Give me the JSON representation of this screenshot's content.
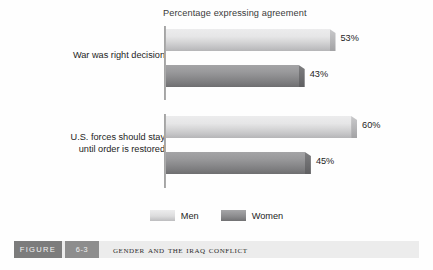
{
  "chart_data": {
    "type": "bar",
    "orientation": "horizontal",
    "title": "Percentage expressing agreement",
    "xlabel": "",
    "ylabel": "",
    "xlim": [
      0,
      70
    ],
    "grid": false,
    "legend_position": "bottom-center",
    "categories": [
      "War was right decision",
      "U.S. forces should stay\nuntil order is restored"
    ],
    "series": [
      {
        "name": "Men",
        "color": "#dcdcdd",
        "values": [
          53,
          60
        ],
        "value_labels": [
          "53%",
          "60%"
        ]
      },
      {
        "name": "Women",
        "color": "#8d8d8f",
        "values": [
          43,
          45
        ],
        "value_labels": [
          "43%",
          "45%"
        ]
      }
    ]
  },
  "caption": {
    "figure_word": "FIGURE",
    "figure_number": "6-3",
    "title": "Gender and the Iraq Conflict"
  }
}
